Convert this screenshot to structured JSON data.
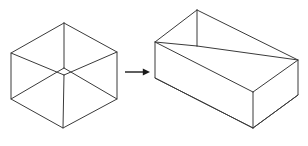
{
  "figure": {
    "background_color": "#ffffff",
    "line_color": "#3a3a3a",
    "arrow_color": "#1a1a1a",
    "width": 308,
    "height": 146
  },
  "shapes": {
    "left": {
      "name": "wireframe-cube",
      "label": "cube",
      "projection": "isometric",
      "visible_edges": 12,
      "outline": "hexagon",
      "vertices": {
        "top": [
          64,
          23
        ],
        "upper_left": [
          11,
          53
        ],
        "upper_right": [
          117,
          52
        ],
        "lower_left": [
          11,
          99
        ],
        "lower_right": [
          117,
          99
        ],
        "bottom": [
          63,
          128
        ],
        "center_front": [
          64,
          75
        ],
        "center_back": [
          64,
          68
        ]
      },
      "polyline_outline": "64,23 117,52 117,99 63,128 11,99 11,53 64,23",
      "internal_edges": [
        "64,23 64,68",
        "11,53 64,75",
        "117,52 64,75",
        "63,128 64,75",
        "11,99 64,68",
        "117,99 64,68"
      ]
    },
    "right": {
      "name": "wireframe-cuboid",
      "label": "rectangular box",
      "projection": "isometric",
      "visible_edges": 12,
      "elongated_axis": "x",
      "vertices": {
        "back_top_left": [
          197,
          10
        ],
        "back_top_right": [
          298,
          60
        ],
        "front_top_left": [
          155,
          42
        ],
        "front_top_right": [
          253,
          92
        ],
        "front_bottom_left": [
          155,
          78
        ],
        "front_bottom_right": [
          253,
          128
        ],
        "back_bottom_left": [
          197,
          46
        ],
        "back_bottom_right": [
          298,
          95
        ]
      },
      "polyline_outline": "197,10 298,60 298,95 253,128 155,78 155,42 197,10",
      "internal_edges": [
        "197,10 197,46",
        "155,42 197,46",
        "298,60 197,46",
        "253,92 253,128",
        "155,42 253,92",
        "298,60 253,92",
        "155,78 253,128",
        "298,95 253,128"
      ]
    }
  },
  "arrow": {
    "name": "transformation-arrow",
    "direction": "right",
    "start": [
      125,
      72
    ],
    "end": [
      150,
      72
    ],
    "head_width": 9,
    "head_height": 7
  }
}
